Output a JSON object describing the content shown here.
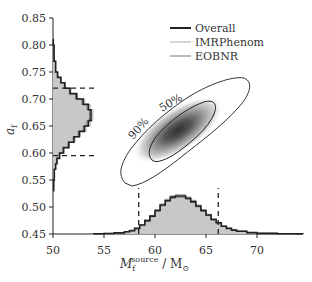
{
  "chart_data": {
    "type": "corner",
    "title": "",
    "xlabel": "M_f^source / M_sun",
    "xlabel_main": "M",
    "xlabel_sub": "f",
    "xlabel_sup": "source",
    "xlabel_unit": "/ M",
    "xlabel_unit_sub": "⊙",
    "ylabel": "a_f",
    "ylabel_main": "a",
    "ylabel_sub": "f",
    "xlim": [
      50,
      74
    ],
    "ylim": [
      0.45,
      0.85
    ],
    "xticks": [
      "50",
      "55",
      "60",
      "65",
      "70"
    ],
    "xtick_values": [
      50,
      55,
      60,
      65,
      70
    ],
    "yticks": [
      "0.45",
      "0.50",
      "0.55",
      "0.60",
      "0.65",
      "0.70",
      "0.75",
      "0.80",
      "0.85"
    ],
    "ytick_values": [
      0.45,
      0.5,
      0.55,
      0.6,
      0.65,
      0.7,
      0.75,
      0.8,
      0.85
    ],
    "legend": [
      {
        "label": "Overall",
        "color": "#222222",
        "width": 2
      },
      {
        "label": "IMRPhenom",
        "color": "#aaaaaa",
        "width": 1
      },
      {
        "label": "EOBNR",
        "color": "#777777",
        "width": 1
      }
    ],
    "contours": [
      {
        "label": "90%",
        "level": 0.9
      },
      {
        "label": "50%",
        "level": 0.5
      }
    ],
    "credible_intervals": {
      "a_f": [
        0.595,
        0.72
      ],
      "M_f": [
        58.4,
        66.2
      ]
    },
    "series": [
      {
        "name": "Overall M_f marginal",
        "x": [
          54,
          55,
          56,
          57,
          57.5,
          58,
          58.5,
          59,
          59.5,
          60,
          60.5,
          61,
          61.5,
          62,
          62.5,
          63,
          63.5,
          64,
          64.5,
          65,
          65.5,
          66,
          66.5,
          67,
          67.5,
          68,
          69,
          70,
          72,
          74
        ],
        "values": [
          0.2,
          0.5,
          1,
          2,
          3,
          5,
          8,
          12,
          16,
          21,
          26,
          30,
          33,
          34,
          34,
          32,
          29,
          25,
          21,
          17,
          13,
          10,
          7,
          5,
          3.5,
          2.5,
          1.2,
          0.6,
          0.2,
          0.1
        ]
      },
      {
        "name": "Overall a_f marginal",
        "x": [
          0.53,
          0.55,
          0.57,
          0.58,
          0.59,
          0.6,
          0.61,
          0.62,
          0.63,
          0.64,
          0.65,
          0.66,
          0.67,
          0.68,
          0.69,
          0.7,
          0.71,
          0.72,
          0.73,
          0.74,
          0.75,
          0.77,
          0.8
        ],
        "values": [
          0.5,
          1,
          2,
          3,
          5,
          8,
          12,
          16,
          20,
          24,
          27,
          29,
          29,
          27,
          23,
          18,
          13,
          9,
          6,
          3.5,
          2,
          0.8,
          0.2
        ]
      }
    ]
  }
}
